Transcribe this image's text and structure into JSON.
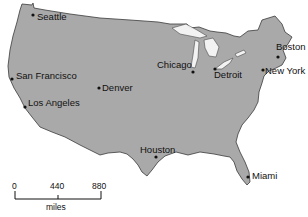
{
  "map": {
    "land_color": "#a9a9a9",
    "outline_color": "#3a3a3a",
    "cities": [
      {
        "name": "Seattle",
        "dot": [
          33,
          15
        ],
        "label": [
          37,
          12
        ]
      },
      {
        "name": "San Francisco",
        "dot": [
          12,
          79
        ],
        "label": [
          16,
          71
        ]
      },
      {
        "name": "Los Angeles",
        "dot": [
          25,
          107
        ],
        "label": [
          28,
          98
        ]
      },
      {
        "name": "Denver",
        "dot": [
          99,
          88
        ],
        "label": [
          102,
          83
        ]
      },
      {
        "name": "Chicago",
        "dot": [
          193,
          72
        ],
        "label": [
          157,
          60
        ]
      },
      {
        "name": "Detroit",
        "dot": [
          215,
          69
        ],
        "label": [
          214,
          70
        ]
      },
      {
        "name": "Boston",
        "dot": [
          278,
          57
        ],
        "label": [
          276,
          42
        ]
      },
      {
        "name": "New York",
        "dot": [
          263,
          70
        ],
        "label": [
          265,
          66
        ]
      },
      {
        "name": "Houston",
        "dot": [
          156,
          157
        ],
        "label": [
          140,
          145
        ]
      },
      {
        "name": "Miami",
        "dot": [
          248,
          177
        ],
        "label": [
          252,
          171
        ]
      }
    ]
  },
  "scale": {
    "ticks": [
      "0",
      "440",
      "880"
    ],
    "unit": "miles"
  }
}
